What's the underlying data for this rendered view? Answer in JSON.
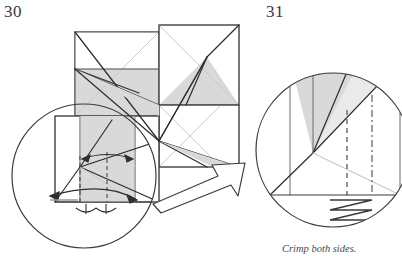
{
  "page": {
    "width": 402,
    "height": 256,
    "background": "#ffffff",
    "type": "origami-instruction-diagram"
  },
  "steps": [
    {
      "id": "step-30",
      "number": "30",
      "number_position": {
        "x": 4,
        "y": 3
      },
      "description": "Pinwheel of four squares with diagonal valley and mountain creases, with a magnifier circle detail at lower left showing dashed reference lines, a double-headed width arrow, a long curved fold arrow and two crimp tick marks."
    },
    {
      "id": "step-31",
      "number": "31",
      "number_position": {
        "x": 266,
        "y": 3
      },
      "description": "Magnified result circle showing the shaded flap, a dashed crease, a dash-dot centre line and a zigzag accordion-pleat symbol below the base edge."
    }
  ],
  "caption": {
    "text": "Crimp both sides.",
    "style": "italic",
    "clipped": true
  },
  "colors": {
    "paper_fill": "#ffffff",
    "shade_fill": "#d9d9d9",
    "shade_fill_light": "#e4e4e4",
    "line_dark": "#2f2f2f",
    "line_mid": "#555555",
    "line_light": "#c2c2c2",
    "circle_stroke": "#3a3a3a",
    "arrow_stroke": "#3d3d3d",
    "text": "#3a3a3a"
  },
  "icons": {
    "magnifier_left": "magnifier-circle-icon",
    "magnifier_right": "magnifier-circle-icon",
    "zoom_arrow": "hollow-zoom-arrow-icon",
    "fold_arrow": "curved-fold-arrow-icon",
    "width_arrow": "double-headed-measure-arrow-icon",
    "crimp_marks": "crimp-tick-marks-icon",
    "pleat": "zigzag-pleat-icon"
  },
  "geometry": {
    "squares": [
      {
        "name": "square-top-left",
        "x": 75,
        "y": 32,
        "w": 84,
        "h": 84
      },
      {
        "name": "square-top-right",
        "x": 159,
        "y": 25,
        "w": 80,
        "h": 80
      },
      {
        "name": "square-bottom-right",
        "x": 159,
        "y": 105,
        "w": 80,
        "h": 62
      },
      {
        "name": "square-bottom-left",
        "x": 55,
        "y": 116,
        "w": 104,
        "h": 86
      }
    ],
    "magnifier_left": {
      "cx": 84,
      "cy": 176,
      "r": 72
    },
    "magnifier_right": {
      "cx": 333,
      "cy": 150,
      "r": 77
    }
  }
}
